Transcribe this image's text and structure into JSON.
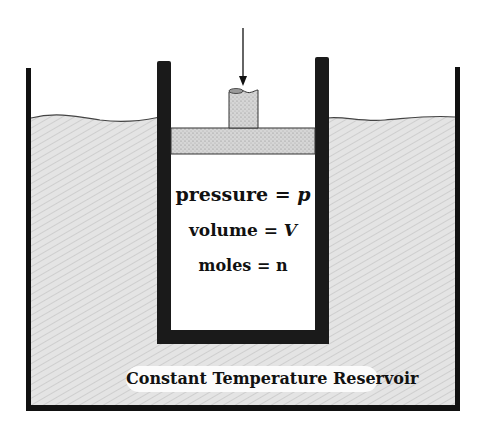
{
  "diagram": {
    "labels": {
      "pressure": {
        "name": "pressure",
        "eq": "=",
        "symbol": "p"
      },
      "volume": {
        "name": "volume",
        "eq": "=",
        "symbol": "V"
      },
      "moles": {
        "name": "moles",
        "eq": "=",
        "symbol": "n"
      },
      "reservoir": "Constant Temperature Reservoir"
    },
    "components": [
      "outer-tank",
      "reservoir-liquid",
      "cylinder",
      "piston",
      "piston-rod",
      "force-arrow",
      "gas-region"
    ],
    "colors": {
      "wall": "#111111",
      "cylinder_wall": "#1a1a1a",
      "liquid": "#d9d9d9",
      "piston": "#cfcfcf",
      "gas": "#ffffff"
    }
  }
}
